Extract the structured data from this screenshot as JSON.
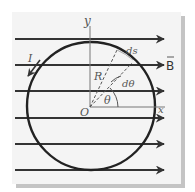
{
  "diagram": {
    "labels": {
      "y_axis": "y",
      "x_axis": "x",
      "origin": "O",
      "radius": "R",
      "current": "I",
      "field": "B",
      "arc_element": "ds",
      "angle": "θ",
      "angle_element": "dθ"
    },
    "field_lines_count": 6,
    "colors": {
      "lines": "#333333",
      "axes": "#777777",
      "labels": "#555555",
      "panel": "#f4f4f4",
      "shadow": "#c4c4c4"
    }
  }
}
